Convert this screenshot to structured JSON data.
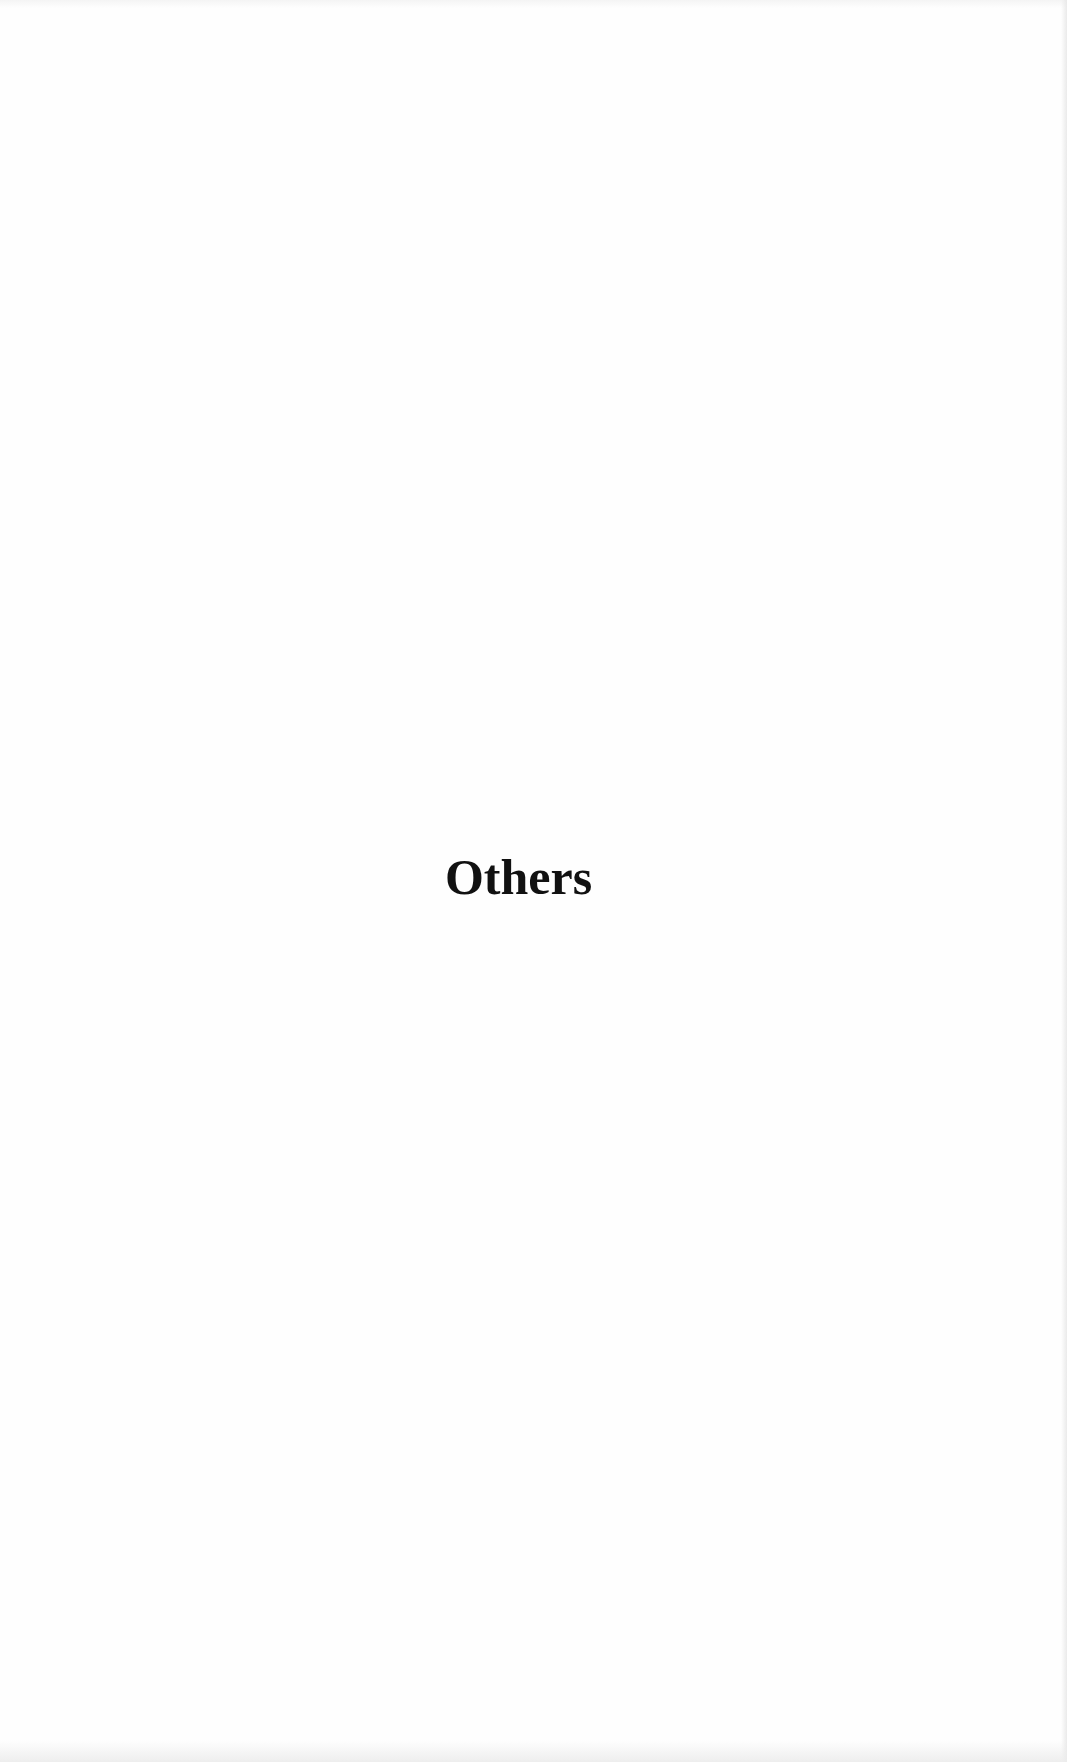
{
  "page": {
    "section_title": "Others",
    "background_color": "#fefefe",
    "text_color": "#111111"
  }
}
